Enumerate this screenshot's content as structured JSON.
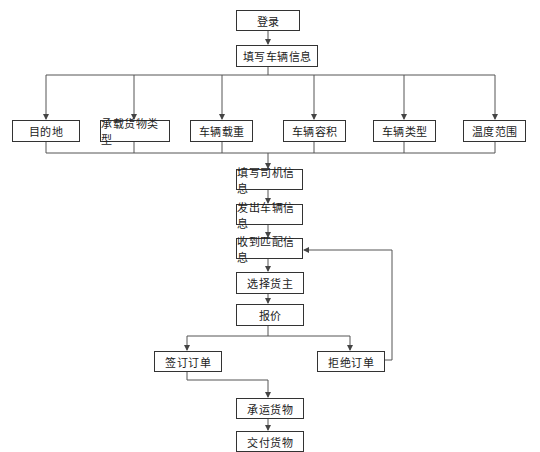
{
  "diagram": {
    "type": "flowchart",
    "nodes": {
      "login": "登录",
      "fill_vehicle_info": "填写车辆信息",
      "destination": "目的地",
      "cargo_type": "承载货物类型",
      "vehicle_load": "车辆载重",
      "vehicle_volume": "车辆容积",
      "vehicle_type": "车辆类型",
      "temperature_range": "温度范围",
      "fill_driver_info": "填写司机信息",
      "send_vehicle_info": "发出车辆信息",
      "receive_match_info": "收到匹配信息",
      "select_shipper": "选择货主",
      "quote": "报价",
      "sign_order": "签订订单",
      "reject_order": "拒绝订单",
      "carry_goods": "承运货物",
      "deliver_goods": "交付货物"
    },
    "edges": [
      [
        "login",
        "fill_vehicle_info"
      ],
      [
        "fill_vehicle_info",
        "destination"
      ],
      [
        "fill_vehicle_info",
        "cargo_type"
      ],
      [
        "fill_vehicle_info",
        "vehicle_load"
      ],
      [
        "fill_vehicle_info",
        "vehicle_volume"
      ],
      [
        "fill_vehicle_info",
        "vehicle_type"
      ],
      [
        "fill_vehicle_info",
        "temperature_range"
      ],
      [
        "destination",
        "fill_driver_info"
      ],
      [
        "cargo_type",
        "fill_driver_info"
      ],
      [
        "vehicle_load",
        "fill_driver_info"
      ],
      [
        "vehicle_volume",
        "fill_driver_info"
      ],
      [
        "vehicle_type",
        "fill_driver_info"
      ],
      [
        "temperature_range",
        "fill_driver_info"
      ],
      [
        "fill_driver_info",
        "send_vehicle_info"
      ],
      [
        "send_vehicle_info",
        "receive_match_info"
      ],
      [
        "receive_match_info",
        "select_shipper"
      ],
      [
        "select_shipper",
        "quote"
      ],
      [
        "quote",
        "sign_order"
      ],
      [
        "quote",
        "reject_order"
      ],
      [
        "reject_order",
        "select_shipper"
      ],
      [
        "sign_order",
        "carry_goods"
      ],
      [
        "carry_goods",
        "deliver_goods"
      ]
    ],
    "colors": {
      "line": "#555555",
      "border": "#333333",
      "text": "#222222"
    }
  }
}
